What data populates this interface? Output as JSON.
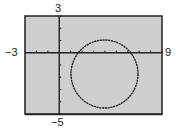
{
  "chart_data": {
    "type": "line",
    "title": "",
    "xlabel": "",
    "ylabel": "",
    "xlim": [
      -3,
      9
    ],
    "ylim": [
      -5,
      3
    ],
    "xscale": 1,
    "yscale": 1,
    "grid": false,
    "tick_labels": {
      "xmin": "−3",
      "xmax": "9",
      "ymax": "3",
      "ymin": "−5"
    },
    "series": [
      {
        "name": "circle",
        "shape": "circle",
        "center": [
          4,
          -2
        ],
        "radius": 3,
        "color": "#1a1a1a"
      }
    ],
    "colors": {
      "background": "#cfcfcf",
      "frame": "#222222",
      "curve": "#1a1a1a"
    }
  }
}
